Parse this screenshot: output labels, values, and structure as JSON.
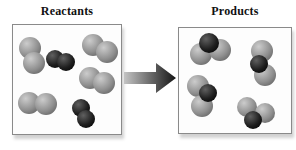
{
  "reactants": {
    "title": "Reactants",
    "molecules": [
      {
        "kind": "gray-diatomic",
        "atoms": [
          {
            "cx": 17,
            "cy": 23,
            "r": 11,
            "color": "gray"
          },
          {
            "cx": 21,
            "cy": 38,
            "r": 11,
            "color": "gray"
          }
        ]
      },
      {
        "kind": "dark-diatomic",
        "atoms": [
          {
            "cx": 42,
            "cy": 34,
            "r": 9,
            "color": "dark"
          },
          {
            "cx": 53,
            "cy": 37,
            "r": 9,
            "color": "dark"
          }
        ]
      },
      {
        "kind": "gray-diatomic",
        "atoms": [
          {
            "cx": 80,
            "cy": 20,
            "r": 11,
            "color": "gray"
          },
          {
            "cx": 94,
            "cy": 27,
            "r": 11,
            "color": "gray"
          }
        ]
      },
      {
        "kind": "gray-diatomic",
        "atoms": [
          {
            "cx": 77,
            "cy": 53,
            "r": 11,
            "color": "gray"
          },
          {
            "cx": 91,
            "cy": 58,
            "r": 11,
            "color": "gray"
          }
        ]
      },
      {
        "kind": "gray-diatomic",
        "atoms": [
          {
            "cx": 16,
            "cy": 78,
            "r": 11,
            "color": "gray"
          },
          {
            "cx": 33,
            "cy": 79,
            "r": 11,
            "color": "gray"
          }
        ]
      },
      {
        "kind": "dark-diatomic",
        "atoms": [
          {
            "cx": 68,
            "cy": 83,
            "r": 9,
            "color": "dark"
          },
          {
            "cx": 73,
            "cy": 94,
            "r": 9,
            "color": "dark"
          }
        ]
      }
    ]
  },
  "products": {
    "title": "Products",
    "molecules": [
      {
        "kind": "gray-gray-dark-triatomic",
        "atoms": [
          {
            "cx": 22,
            "cy": 26,
            "r": 11,
            "color": "gray"
          },
          {
            "cx": 41,
            "cy": 22,
            "r": 11,
            "color": "gray"
          },
          {
            "cx": 30,
            "cy": 15,
            "r": 10,
            "color": "dark"
          }
        ]
      },
      {
        "kind": "gray-gray-dark-triatomic",
        "atoms": [
          {
            "cx": 83,
            "cy": 23,
            "r": 11,
            "color": "gray"
          },
          {
            "cx": 86,
            "cy": 47,
            "r": 11,
            "color": "gray"
          },
          {
            "cx": 80,
            "cy": 36,
            "r": 9,
            "color": "dark"
          }
        ]
      },
      {
        "kind": "gray-gray-dark-triatomic",
        "atoms": [
          {
            "cx": 19,
            "cy": 58,
            "r": 11,
            "color": "gray"
          },
          {
            "cx": 23,
            "cy": 78,
            "r": 11,
            "color": "gray"
          },
          {
            "cx": 29,
            "cy": 65,
            "r": 9,
            "color": "dark"
          }
        ]
      },
      {
        "kind": "gray-gray-dark-triatomic",
        "atoms": [
          {
            "cx": 68,
            "cy": 79,
            "r": 10,
            "color": "gray"
          },
          {
            "cx": 86,
            "cy": 85,
            "r": 10,
            "color": "gray"
          },
          {
            "cx": 74,
            "cy": 92,
            "r": 9,
            "color": "dark"
          }
        ]
      }
    ]
  },
  "arrow": {
    "direction": "right"
  },
  "colors": {
    "gray_atom_highlight": "#cccccc",
    "gray_atom_mid": "#8f8f8f",
    "gray_atom_edge": "#585858",
    "dark_atom_highlight": "#606060",
    "dark_atom_mid": "#1e1e1e",
    "dark_atom_edge": "#000000",
    "box_border": "#8a8a8a",
    "background": "#ffffff",
    "arrow_start": "#c4c4c4",
    "arrow_end": "#141414",
    "title_color": "#111111"
  }
}
